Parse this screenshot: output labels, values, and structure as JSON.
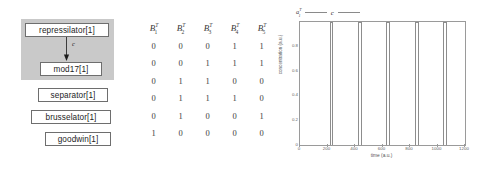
{
  "diagram": {
    "group_label": "",
    "nodes": [
      {
        "id": "repressilator",
        "label": "repressilator[1]"
      },
      {
        "id": "mod17",
        "label": "mod17[1]"
      },
      {
        "id": "separator",
        "label": "separator[1]"
      },
      {
        "id": "brusselator",
        "label": "brusselator[1]"
      },
      {
        "id": "goodwin",
        "label": "goodwin[1]"
      }
    ],
    "edge_label": "c"
  },
  "matrix": {
    "headers": [
      {
        "base": "B",
        "sub": "1",
        "sup": "T"
      },
      {
        "base": "B",
        "sub": "2",
        "sup": "T"
      },
      {
        "base": "B",
        "sub": "3",
        "sup": "T"
      },
      {
        "base": "B",
        "sub": "4",
        "sup": "T"
      },
      {
        "base": "B",
        "sub": "5",
        "sup": "T"
      }
    ],
    "rows": [
      [
        "0",
        "0",
        "0",
        "1",
        "1"
      ],
      [
        "0",
        "0",
        "1",
        "1",
        "1"
      ],
      [
        "0",
        "1",
        "1",
        "0",
        "0"
      ],
      [
        "0",
        "1",
        "1",
        "1",
        "0"
      ],
      [
        "0",
        "1",
        "0",
        "0",
        "1"
      ],
      [
        "1",
        "0",
        "0",
        "0",
        "0"
      ]
    ]
  },
  "chart_data": {
    "type": "line",
    "title": "",
    "xlabel": "time (a.u.)",
    "ylabel": "concentration (a.u.)",
    "xlim": [
      0,
      1200
    ],
    "ylim": [
      0,
      1.0
    ],
    "xticks": [
      0,
      200,
      400,
      600,
      800,
      1000,
      1200
    ],
    "xtick_labels": [
      "0",
      "200",
      "400",
      "600",
      "800",
      "1000",
      "1200"
    ],
    "yticks": [
      0,
      0.2,
      0.4,
      0.6,
      0.8
    ],
    "ytick_labels": [
      "0",
      "0.2",
      "0.4",
      "0.6",
      "0.8"
    ],
    "grid": false,
    "legend_position": "top-left",
    "legend": [
      {
        "base": "a",
        "sub": "1",
        "sup": "T",
        "label": ""
      },
      {
        "base": "",
        "sub": "",
        "sup": "",
        "label": "c"
      }
    ],
    "series": [
      {
        "name": "c",
        "description": "square-wave pulse train saturating at 1.0",
        "pulses": [
          {
            "start": 215,
            "end": 240
          },
          {
            "start": 420,
            "end": 448
          },
          {
            "start": 625,
            "end": 655
          },
          {
            "start": 835,
            "end": 862
          },
          {
            "start": 1042,
            "end": 1070
          }
        ],
        "baseline": 1.0,
        "peak": 1.0
      }
    ]
  }
}
